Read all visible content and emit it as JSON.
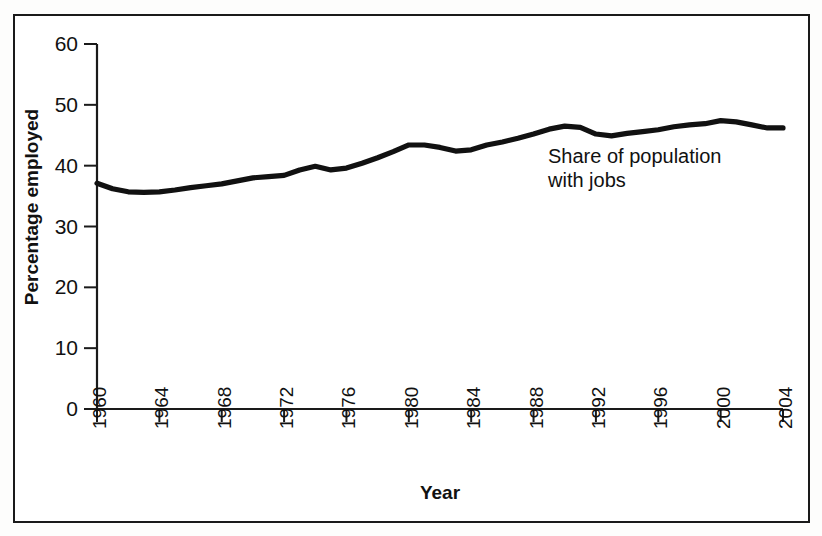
{
  "figure": {
    "y_axis_title": "Percentage employed",
    "x_axis_title": "Year",
    "annotation": "Share of population\nwith jobs",
    "line_color": "#111111",
    "axis_color": "#1a1a1a",
    "background_color": "#ffffff"
  },
  "chart_data": {
    "type": "line",
    "title": "",
    "subtitle": "",
    "xlabel": "Year",
    "ylabel": "Percentage employed",
    "xlim": [
      1960,
      2004
    ],
    "ylim": [
      0,
      60
    ],
    "grid": false,
    "legend_position": "none",
    "annotations": [
      {
        "text": "Share of population with jobs",
        "x": 1992,
        "y": 40
      }
    ],
    "x_tick_labels": [
      "1960",
      "1964",
      "1968",
      "1972",
      "1976",
      "1980",
      "1984",
      "1988",
      "1992",
      "1996",
      "2000",
      "2004"
    ],
    "x_ticks": [
      1960,
      1964,
      1968,
      1972,
      1976,
      1980,
      1984,
      1988,
      1992,
      1996,
      2000,
      2004
    ],
    "y_tick_labels": [
      "0",
      "10",
      "20",
      "30",
      "40",
      "50",
      "60"
    ],
    "y_ticks": [
      0,
      10,
      20,
      30,
      40,
      50,
      60
    ],
    "series": [
      {
        "name": "Share of population with jobs",
        "x": [
          1960,
          1961,
          1962,
          1963,
          1964,
          1965,
          1966,
          1967,
          1968,
          1969,
          1970,
          1971,
          1972,
          1973,
          1974,
          1975,
          1976,
          1977,
          1978,
          1979,
          1980,
          1981,
          1982,
          1983,
          1984,
          1985,
          1986,
          1987,
          1988,
          1989,
          1990,
          1991,
          1992,
          1993,
          1994,
          1995,
          1996,
          1997,
          1998,
          1999,
          2000,
          2001,
          2002,
          2003,
          2004
        ],
        "values": [
          37.1,
          36.2,
          35.7,
          35.6,
          35.7,
          36.0,
          36.4,
          36.7,
          37.0,
          37.5,
          38.0,
          38.2,
          38.4,
          39.3,
          39.9,
          39.3,
          39.6,
          40.4,
          41.3,
          42.3,
          43.4,
          43.4,
          43.0,
          42.4,
          42.6,
          43.4,
          43.9,
          44.5,
          45.2,
          46.0,
          46.5,
          46.3,
          45.2,
          44.9,
          45.3,
          45.6,
          45.9,
          46.4,
          46.7,
          46.9,
          47.4,
          47.2,
          46.7,
          46.2,
          46.2
        ]
      }
    ]
  }
}
